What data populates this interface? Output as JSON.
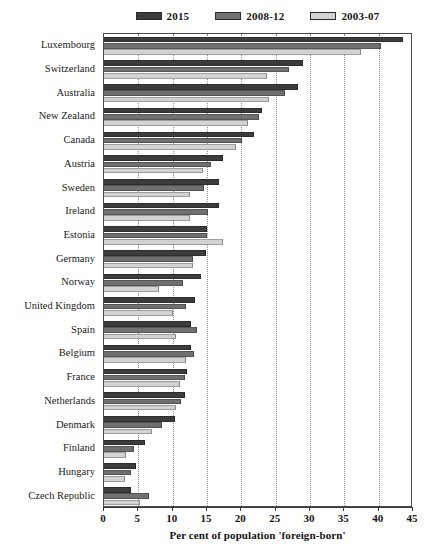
{
  "chart_data": {
    "type": "bar",
    "orientation": "horizontal",
    "title": "",
    "xlabel": "Per cent of population 'foreign-born'",
    "ylabel": "",
    "xlim": [
      0,
      45
    ],
    "xticks": [
      0,
      5,
      10,
      15,
      20,
      25,
      30,
      35,
      40,
      45
    ],
    "grid": "vertical-dotted",
    "legend_position": "top-center",
    "categories": [
      "Luxembourg",
      "Switzerland",
      "Australia",
      "New Zealand",
      "Canada",
      "Austria",
      "Sweden",
      "Ireland",
      "Estonia",
      "Germany",
      "Norway",
      "United Kingdom",
      "Spain",
      "Belgium",
      "France",
      "Netherlands",
      "Denmark",
      "Finland",
      "Hungary",
      "Czech Republic"
    ],
    "series": [
      {
        "name": "2015",
        "color": "#3c3c3c",
        "values": [
          43.5,
          29.0,
          28.2,
          23.0,
          21.8,
          17.4,
          16.8,
          16.8,
          15.0,
          14.9,
          14.1,
          13.2,
          12.7,
          12.6,
          12.1,
          11.8,
          10.4,
          6.0,
          4.6,
          3.9
        ]
      },
      {
        "name": "2008-12",
        "color": "#707070",
        "values": [
          40.4,
          27.0,
          26.3,
          22.5,
          20.1,
          15.6,
          14.5,
          15.1,
          15.0,
          12.9,
          11.5,
          11.9,
          13.6,
          13.1,
          11.8,
          11.2,
          8.5,
          4.4,
          4.0,
          6.6
        ]
      },
      {
        "name": "2003-07",
        "color": "#d2d2d2",
        "values": [
          37.4,
          23.8,
          24.0,
          21.0,
          19.2,
          14.4,
          12.5,
          12.5,
          17.3,
          12.9,
          8.0,
          10.0,
          10.5,
          12.0,
          11.0,
          10.5,
          7.0,
          3.2,
          3.0,
          5.2
        ]
      }
    ]
  },
  "legend": {
    "items": [
      {
        "label": "2015",
        "color": "#3c3c3c"
      },
      {
        "label": "2008-12",
        "color": "#707070"
      },
      {
        "label": "2003-07",
        "color": "#d2d2d2"
      }
    ]
  }
}
